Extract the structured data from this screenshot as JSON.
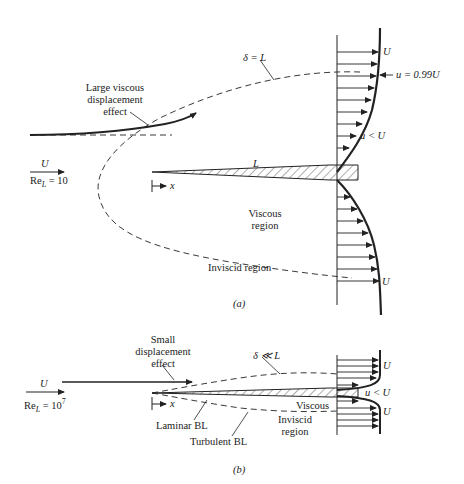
{
  "figure_a": {
    "caption": "(a)",
    "freestream_velocity": "U",
    "reynolds_label": "Re",
    "reynolds_sub": "L",
    "reynolds_value": "= 10",
    "annotation_large_displacement": [
      "Large viscous",
      "displacement",
      "effect"
    ],
    "delta_label": "δ = L",
    "plate_length_label": "L",
    "x_axis_label": "x",
    "edge_velocity_label": "u = 0.99U",
    "profile_top_label": "U",
    "profile_inner_label": "u < U",
    "profile_bottom_label": "U",
    "viscous_region_label": [
      "Viscous",
      "region"
    ],
    "inviscid_region_label": "Inviscid region"
  },
  "figure_b": {
    "caption": "(b)",
    "freestream_velocity": "U",
    "reynolds_label": "Re",
    "reynolds_sub": "L",
    "reynolds_value": "= 10",
    "reynolds_exp": "7",
    "annotation_small_displacement": [
      "Small",
      "displacement",
      "effect"
    ],
    "delta_label": "δ ≪ L",
    "x_axis_label": "x",
    "profile_top_label": "U",
    "profile_inner_label": "u < U",
    "profile_bottom_label": "U",
    "viscous_label": "Viscous",
    "inviscid_region_label": [
      "Inviscid",
      "region"
    ],
    "laminar_label": "Laminar BL",
    "turbulent_label": "Turbulent BL"
  },
  "colors": {
    "ink": "#222222",
    "background": "#ffffff"
  }
}
